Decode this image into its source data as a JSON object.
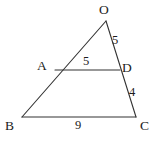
{
  "figure": {
    "type": "geometry-diagram",
    "background_color": "#ffffff",
    "stroke_color": "#333333",
    "text_color": "#1c1c1c",
    "width": 159,
    "height": 142
  },
  "vertices": {
    "O": {
      "label": "O",
      "x": 106,
      "y": 21
    },
    "A": {
      "label": "A",
      "x": 55,
      "y": 70
    },
    "D": {
      "label": "D",
      "x": 120,
      "y": 70
    },
    "B": {
      "label": "B",
      "x": 22,
      "y": 117
    },
    "C": {
      "label": "C",
      "x": 136,
      "y": 117
    }
  },
  "segments": [
    {
      "name": "OB",
      "from": "O",
      "to": "B",
      "x1": 106,
      "y1": 21,
      "x2": 22,
      "y2": 117
    },
    {
      "name": "OC",
      "from": "O",
      "to": "C",
      "x1": 106,
      "y1": 21,
      "x2": 136,
      "y2": 117
    },
    {
      "name": "AD",
      "from": "A",
      "to": "D",
      "x1": 55,
      "y1": 70,
      "x2": 120,
      "y2": 70
    },
    {
      "name": "BC",
      "from": "B",
      "to": "C",
      "x1": 22,
      "y1": 117,
      "x2": 136,
      "y2": 117
    }
  ],
  "measures": {
    "OD": "5",
    "AD": "5",
    "DC": "4",
    "BC": "9"
  }
}
